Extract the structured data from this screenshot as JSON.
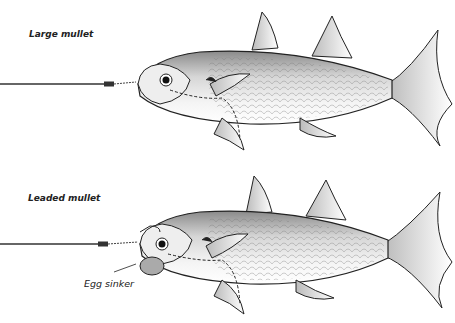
{
  "figure": {
    "type": "illustration",
    "panels": [
      {
        "title": "Large mullet",
        "rig": "wire leader with twisted haywire through head"
      },
      {
        "title": "Leaded mullet",
        "rig": "wire leader with egg sinker under jaw",
        "callouts": [
          "Egg sinker"
        ]
      }
    ]
  },
  "labels": {
    "top": "Large mullet",
    "bottom": "Leaded mullet",
    "callout": "Egg sinker"
  },
  "colors": {
    "line": "#222222",
    "leader": "#777777",
    "body_fill": "#e9e9e9",
    "back_shade": "#9a9a9a",
    "background": "#ffffff"
  }
}
